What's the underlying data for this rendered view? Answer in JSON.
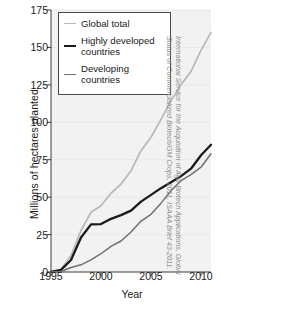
{
  "chart_data": {
    "type": "line",
    "title": "",
    "xlabel": "Year",
    "ylabel": "Millions of hectares planted",
    "xlim": [
      1995,
      2011
    ],
    "ylim": [
      0,
      175
    ],
    "xticks": [
      "1995",
      "2000",
      "2005",
      "2010"
    ],
    "xtick_values": [
      1995,
      2000,
      2005,
      2010
    ],
    "yticks": [
      "0",
      "25",
      "50",
      "75",
      "100",
      "125",
      "150",
      "175"
    ],
    "ytick_values": [
      0,
      25,
      50,
      75,
      100,
      125,
      150,
      175
    ],
    "grid": false,
    "legend_position": "top-left",
    "x": [
      1995,
      1996,
      1997,
      1998,
      1999,
      2000,
      2001,
      2002,
      2003,
      2004,
      2005,
      2006,
      2007,
      2008,
      2009,
      2010,
      2011
    ],
    "series": [
      {
        "name": "Global total",
        "color": "#b8b8b8",
        "values": [
          0,
          1.7,
          11,
          27.8,
          39.9,
          44.2,
          52.6,
          58.7,
          67.7,
          81,
          90,
          102,
          114.3,
          125,
          134,
          148,
          160
        ]
      },
      {
        "name": "Highly developed countries",
        "color": "#1a1a1a",
        "values": [
          0,
          1.4,
          8,
          23,
          31.8,
          32,
          35.5,
          38,
          41,
          47,
          51.5,
          56,
          60,
          64,
          69,
          78,
          85
        ]
      },
      {
        "name": "Developing countries",
        "color": "#707070",
        "values": [
          0,
          0.3,
          3,
          4.8,
          8.1,
          12.2,
          17.1,
          20.7,
          26.7,
          34,
          38.5,
          46,
          54.3,
          61,
          65,
          70,
          79
        ]
      }
    ]
  },
  "legend": {
    "entries": [
      {
        "label": "Global total"
      },
      {
        "label": "Highly developed countries"
      },
      {
        "label": "Developing countries"
      }
    ]
  },
  "credit": {
    "text": "International Service for the Acquisition of Agri-Biotech Applications, Global Status of Commercialized Biotech/GM Crops, 2011, ISAAA Brief 43-2011."
  }
}
